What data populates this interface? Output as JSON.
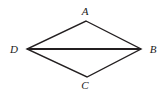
{
  "figure": {
    "type": "geometry-diagram",
    "canvas": {
      "width": 164,
      "height": 94
    },
    "background_color": "#ffffff",
    "stroke_color": "#231f20",
    "label_color": "#1a1a1a",
    "vertices": [
      {
        "id": "A",
        "label": "A",
        "x": 86,
        "y": 21,
        "label_x": 85,
        "label_y": 11
      },
      {
        "id": "B",
        "label": "B",
        "x": 141,
        "y": 49,
        "label_x": 153,
        "label_y": 49
      },
      {
        "id": "C",
        "label": "C",
        "x": 87,
        "y": 77,
        "label_x": 85,
        "label_y": 85
      },
      {
        "id": "D",
        "label": "D",
        "x": 27,
        "y": 49,
        "label_x": 14,
        "label_y": 49
      }
    ],
    "edges": [
      {
        "id": "DA",
        "from": "D",
        "to": "A",
        "width": 1.4
      },
      {
        "id": "AB",
        "from": "A",
        "to": "B",
        "width": 1.4
      },
      {
        "id": "BC",
        "from": "B",
        "to": "C",
        "width": 1.4
      },
      {
        "id": "CD",
        "from": "C",
        "to": "D",
        "width": 1.4
      }
    ],
    "diagonals": [
      {
        "id": "DB",
        "from": "D",
        "to": "B",
        "width": 2.0
      }
    ]
  }
}
